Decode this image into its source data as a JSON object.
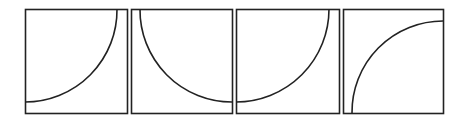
{
  "figure": {
    "stroke_color": "#222222",
    "background": "#ffffff",
    "panels": [
      {
        "id": 1,
        "x": 25,
        "y": 9,
        "w": 102,
        "h": 104,
        "arc_start": [
          117,
          9
        ],
        "arc_end": [
          25,
          102
        ],
        "radius": 92,
        "sweep": 1
      },
      {
        "id": 2,
        "x": 131,
        "y": 9,
        "w": 101,
        "h": 104,
        "arc_start": [
          140,
          9
        ],
        "arc_end": [
          232,
          102
        ],
        "radius": 92,
        "sweep": 0
      },
      {
        "id": 3,
        "x": 236,
        "y": 9,
        "w": 103,
        "h": 104,
        "arc_start": [
          329,
          9
        ],
        "arc_end": [
          236,
          102
        ],
        "radius": 93,
        "sweep": 1
      },
      {
        "id": 4,
        "x": 343,
        "y": 9,
        "w": 100,
        "h": 104,
        "arc_start": [
          352,
          113
        ],
        "arc_end": [
          443,
          21
        ],
        "radius": 91,
        "sweep": 1
      }
    ]
  }
}
